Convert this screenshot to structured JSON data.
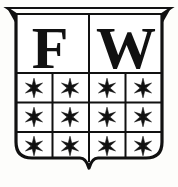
{
  "emblem": {
    "kind": "heraldic-shield-bookplate",
    "title": "FW Coat of Arms",
    "ink_color": "#111111",
    "field_color": "#ffffff",
    "background_color": "#fdfdfb",
    "chief": {
      "divided": true,
      "cells": [
        {
          "label": "F"
        },
        {
          "label": "W"
        }
      ]
    },
    "grid": {
      "columns": 4,
      "rows": 3,
      "cell_count": 12,
      "charge_name": "six-pointed-star-icon",
      "charge_glyph": "*",
      "cells": [
        {
          "row": 1,
          "col": 1,
          "charge": "*"
        },
        {
          "row": 1,
          "col": 2,
          "charge": "*"
        },
        {
          "row": 1,
          "col": 3,
          "charge": "*"
        },
        {
          "row": 1,
          "col": 4,
          "charge": "*"
        },
        {
          "row": 2,
          "col": 1,
          "charge": "*"
        },
        {
          "row": 2,
          "col": 2,
          "charge": "*"
        },
        {
          "row": 2,
          "col": 3,
          "charge": "*"
        },
        {
          "row": 2,
          "col": 4,
          "charge": "*"
        },
        {
          "row": 3,
          "col": 1,
          "charge": "*"
        },
        {
          "row": 3,
          "col": 2,
          "charge": "*"
        },
        {
          "row": 3,
          "col": 3,
          "charge": "*"
        },
        {
          "row": 3,
          "col": 4,
          "charge": "*"
        }
      ]
    }
  }
}
